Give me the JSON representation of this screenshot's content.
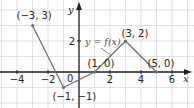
{
  "chart_data": {
    "type": "line",
    "title": "",
    "function_label": "y = f(x)",
    "xlabel": "x",
    "ylabel": "y",
    "xlim": [
      -5,
      7
    ],
    "ylim": [
      -2,
      3.5
    ],
    "x_ticks": [
      "-4",
      "-2",
      "2",
      "4",
      "6"
    ],
    "y_ticks": [
      "2"
    ],
    "origin_label": "0",
    "grid": true,
    "series": [
      {
        "name": "f(x)",
        "points": [
          {
            "x": -3,
            "y": 3,
            "label": "(-3, 3)"
          },
          {
            "x": -1,
            "y": -1,
            "label": "(-1, -1)"
          },
          {
            "x": 1,
            "y": 0,
            "label": "(1, 0)"
          },
          {
            "x": 3,
            "y": 2,
            "label": "(3, 2)"
          },
          {
            "x": 5,
            "y": 0,
            "label": "(5, 0)"
          }
        ]
      }
    ],
    "colors": {
      "grid": "#d9d9d9",
      "axis": "#222222",
      "curve": "#6e6e6e"
    }
  }
}
